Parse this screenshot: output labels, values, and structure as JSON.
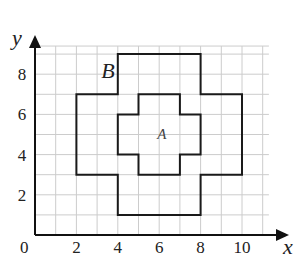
{
  "diagram": {
    "type": "coordinate-grid",
    "x_axis": {
      "label": "x",
      "ticks": [
        "2",
        "4",
        "6",
        "8",
        "10"
      ],
      "origin_label": "0",
      "range": [
        0,
        11
      ]
    },
    "y_axis": {
      "label": "y",
      "ticks": [
        "2",
        "4",
        "6",
        "8"
      ],
      "range": [
        0,
        9
      ]
    },
    "grid": {
      "color": "#cccccc",
      "step": 1
    },
    "shapes": [
      {
        "name": "B",
        "label": "B",
        "label_pos": [
          3.2,
          7.8
        ],
        "vertices": [
          [
            4,
            9
          ],
          [
            8,
            9
          ],
          [
            8,
            7
          ],
          [
            10,
            7
          ],
          [
            10,
            3
          ],
          [
            8,
            3
          ],
          [
            8,
            1
          ],
          [
            4,
            1
          ],
          [
            4,
            3
          ],
          [
            2,
            3
          ],
          [
            2,
            7
          ],
          [
            4,
            7
          ]
        ]
      },
      {
        "name": "A",
        "label": "A",
        "label_pos": [
          5.9,
          4.8
        ],
        "vertices": [
          [
            5,
            7
          ],
          [
            7,
            7
          ],
          [
            7,
            6
          ],
          [
            8,
            6
          ],
          [
            8,
            4
          ],
          [
            7,
            4
          ],
          [
            7,
            3
          ],
          [
            5,
            3
          ],
          [
            5,
            4
          ],
          [
            4,
            4
          ],
          [
            4,
            6
          ],
          [
            5,
            6
          ]
        ]
      }
    ],
    "line_color": "#1a1a1a"
  }
}
